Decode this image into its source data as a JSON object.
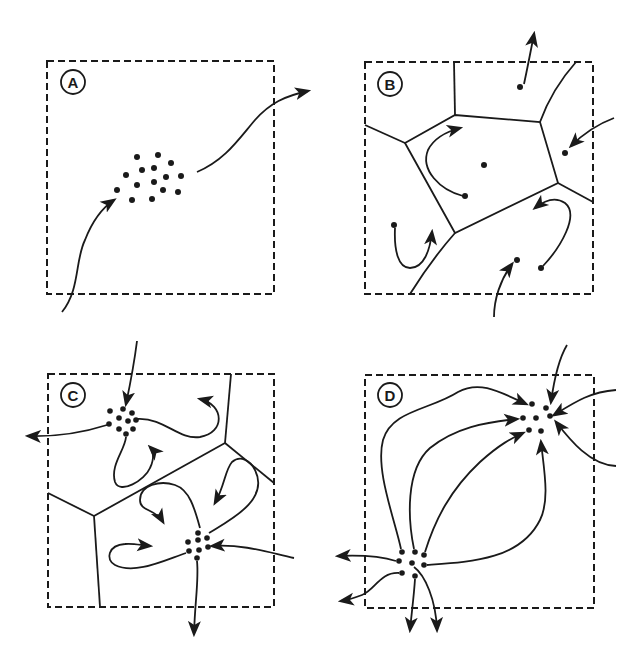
{
  "figure": {
    "panels": [
      {
        "id": "A",
        "label": "A",
        "description": "Dispersed cell cluster with single migration path entering and exiting"
      },
      {
        "id": "B",
        "label": "B",
        "description": "Single cells within polygonal domains, short curved migration arrows"
      },
      {
        "id": "C",
        "label": "C",
        "description": "Two small cell clusters within polygonal domains, looping paths and exits"
      },
      {
        "id": "D",
        "label": "D",
        "description": "Two clusters connected by multiple converging curved paths"
      }
    ]
  },
  "colors": {
    "ink": "#1a1a1a",
    "background": "#ffffff"
  }
}
